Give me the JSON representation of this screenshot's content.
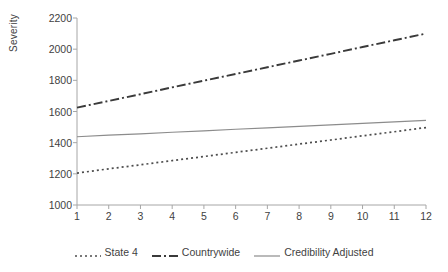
{
  "chart_data": {
    "type": "line",
    "title": "",
    "xlabel": "",
    "ylabel": "Severity",
    "x": [
      1,
      2,
      3,
      4,
      5,
      6,
      7,
      8,
      9,
      10,
      11,
      12
    ],
    "xlim": [
      1,
      12
    ],
    "ylim": [
      1000,
      2200
    ],
    "ytick_labels": [
      "2200",
      "2000",
      "1800",
      "1600",
      "1400",
      "1200",
      "1000"
    ],
    "yticks": [
      2200,
      2000,
      1800,
      1600,
      1400,
      1200,
      1000
    ],
    "xtick_labels": [
      "1",
      "2",
      "3",
      "4",
      "5",
      "6",
      "7",
      "8",
      "9",
      "10",
      "11",
      "12"
    ],
    "grid": false,
    "legend_position": "bottom",
    "series": [
      {
        "name": "State 4",
        "style": "dotted",
        "color": "#4d4d4d",
        "values": [
          1205,
          1232,
          1258,
          1285,
          1311,
          1338,
          1364,
          1391,
          1417,
          1444,
          1470,
          1497
        ]
      },
      {
        "name": "Countrywide",
        "style": "dash-dot",
        "color": "#3a3a3a",
        "values": [
          1625,
          1668,
          1711,
          1755,
          1798,
          1841,
          1884,
          1927,
          1970,
          2014,
          2057,
          2100
        ]
      },
      {
        "name": "Credibility Adjusted",
        "style": "solid",
        "color": "#8c8c8c",
        "values": [
          1438,
          1448,
          1457,
          1467,
          1476,
          1486,
          1495,
          1505,
          1514,
          1524,
          1533,
          1543
        ]
      }
    ]
  },
  "legend": {
    "items": [
      {
        "label": "State 4",
        "style": "dotted"
      },
      {
        "label": "Countrywide",
        "style": "dash-dot"
      },
      {
        "label": "Credibility Adjusted",
        "style": "solid"
      }
    ]
  },
  "axes": {
    "y_title": "Severity"
  },
  "colors": {
    "axis": "#a6a6a6",
    "text": "#3f3f3f",
    "series_state4": "#4d4d4d",
    "series_countrywide": "#3a3a3a",
    "series_credibility": "#8c8c8c"
  }
}
